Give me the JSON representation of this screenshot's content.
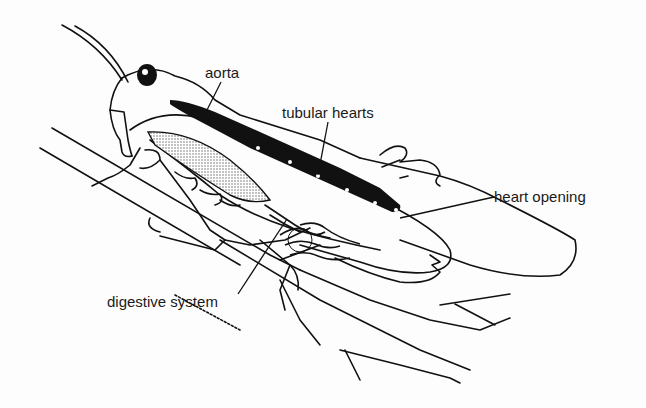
{
  "diagram": {
    "labels": [
      {
        "id": "aorta",
        "text": "aorta",
        "x": 205,
        "y": 65
      },
      {
        "id": "tubular-hearts",
        "text": "tubular hearts",
        "x": 282,
        "y": 105
      },
      {
        "id": "heart-opening",
        "text": "heart opening",
        "x": 494,
        "y": 189
      },
      {
        "id": "digestive-system",
        "text": "digestive system",
        "x": 107,
        "y": 294
      }
    ]
  },
  "colors": {
    "ink": "#111111",
    "background": "#fdfdfd",
    "stipple": "#9a9a9a"
  }
}
